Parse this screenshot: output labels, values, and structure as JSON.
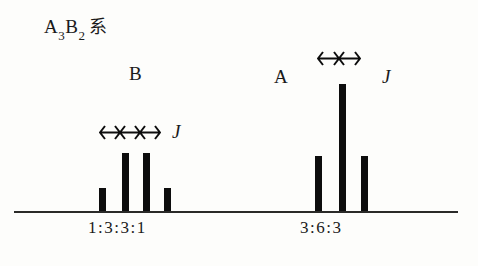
{
  "title": {
    "prefix": "A",
    "sub1": "3",
    "mid": "B",
    "sub2": "2",
    "kanji": "系",
    "full": "A3B2 系"
  },
  "colors": {
    "background": "#fdfdfb",
    "ink": "#0d0d0d",
    "baseline": "#2a2a28"
  },
  "chart_data": {
    "type": "bar",
    "xlabel": "",
    "ylabel": "",
    "grid": false,
    "legend": "none",
    "axis": {
      "baseline_only": true,
      "x_start_px": 14,
      "x_end_px": 458,
      "baseline_y_px": 211
    },
    "groups": [
      {
        "name": "B",
        "label": "B",
        "label_x": 129,
        "label_y": 64,
        "multiplicity": "quartet",
        "ratio_text": "1:3:3:1",
        "ratio_x": 88,
        "ratio_y": 219,
        "coupling_label": "J",
        "coupling_label_x": 172,
        "coupling_label_y": 122,
        "arrows": 3,
        "arrow_x": 99,
        "arrow_y": 125,
        "arrow_span": 22,
        "values": [
          1,
          3,
          3,
          1
        ],
        "peaks": [
          {
            "x": 99,
            "height": 23
          },
          {
            "x": 122,
            "height": 58
          },
          {
            "x": 143,
            "height": 58
          },
          {
            "x": 164,
            "height": 23
          }
        ]
      },
      {
        "name": "A",
        "label": "A",
        "label_x": 274,
        "label_y": 67,
        "multiplicity": "triplet",
        "ratio_text": "3:6:3",
        "ratio_x": 300,
        "ratio_y": 219,
        "coupling_label": "J",
        "coupling_label_x": 382,
        "coupling_label_y": 67,
        "arrows": 2,
        "arrow_x": 317,
        "arrow_y": 51,
        "arrow_span": 23,
        "values": [
          3,
          6,
          3
        ],
        "peaks": [
          {
            "x": 315,
            "height": 55
          },
          {
            "x": 339,
            "height": 127
          },
          {
            "x": 361,
            "height": 55
          }
        ]
      }
    ]
  }
}
